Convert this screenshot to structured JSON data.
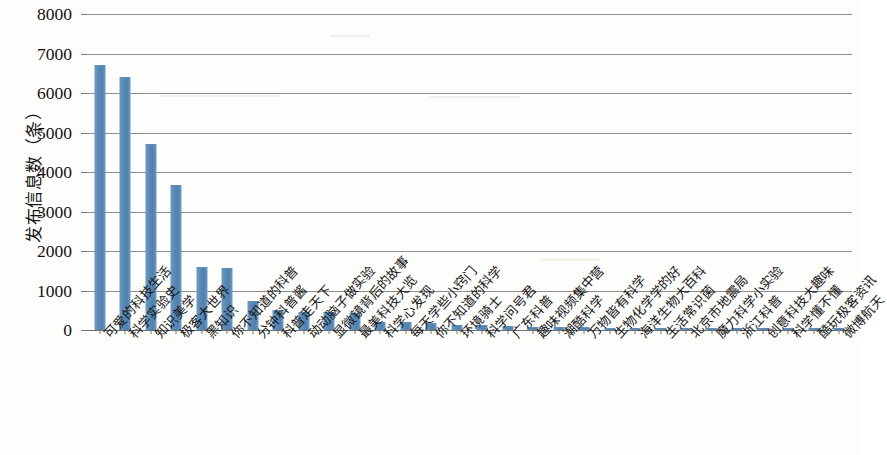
{
  "chart_data": {
    "type": "bar",
    "title": "",
    "xlabel": "",
    "ylabel": "发布信息数（条）",
    "ylim": [
      0,
      8000
    ],
    "ytick_step": 1000,
    "yticks": [
      "0",
      "1000",
      "2000",
      "3000",
      "4000",
      "5000",
      "6000",
      "7000",
      "8000"
    ],
    "grid": true,
    "legend": false,
    "bar_color": "#5b8ab8",
    "gridline_color": "#8d8d8d",
    "categories": [
      "可爱的科技生活",
      "科学实验史",
      "知识美学",
      "极客大世界",
      "黑知识",
      "你不知道的科普",
      "分钟科普酱",
      "科普走天下",
      "动动脑子做实验",
      "显微镜背后的故事",
      "最美科技大览",
      "科学心发现",
      "每天学些小窍门",
      "你不知道的科学",
      "环境骑士",
      "科学问号君",
      "广东科普",
      "趣味视频集中营",
      "潮酷科学",
      "万物皆有科学",
      "生物化学学的好",
      "海洋生物大百科",
      "生活常识菌",
      "北京市地震局",
      "魔力科学小实验",
      "浙江科普",
      "创意科技大趣味",
      "科学懂不懂",
      "酷玩极客资讯",
      "微博航天"
    ],
    "values": [
      6680,
      6380,
      4680,
      3650,
      1560,
      1550,
      700,
      480,
      440,
      420,
      400,
      190,
      180,
      150,
      110,
      95,
      70,
      55,
      45,
      40,
      38,
      35,
      32,
      30,
      28,
      25,
      22,
      20,
      18,
      15
    ]
  }
}
